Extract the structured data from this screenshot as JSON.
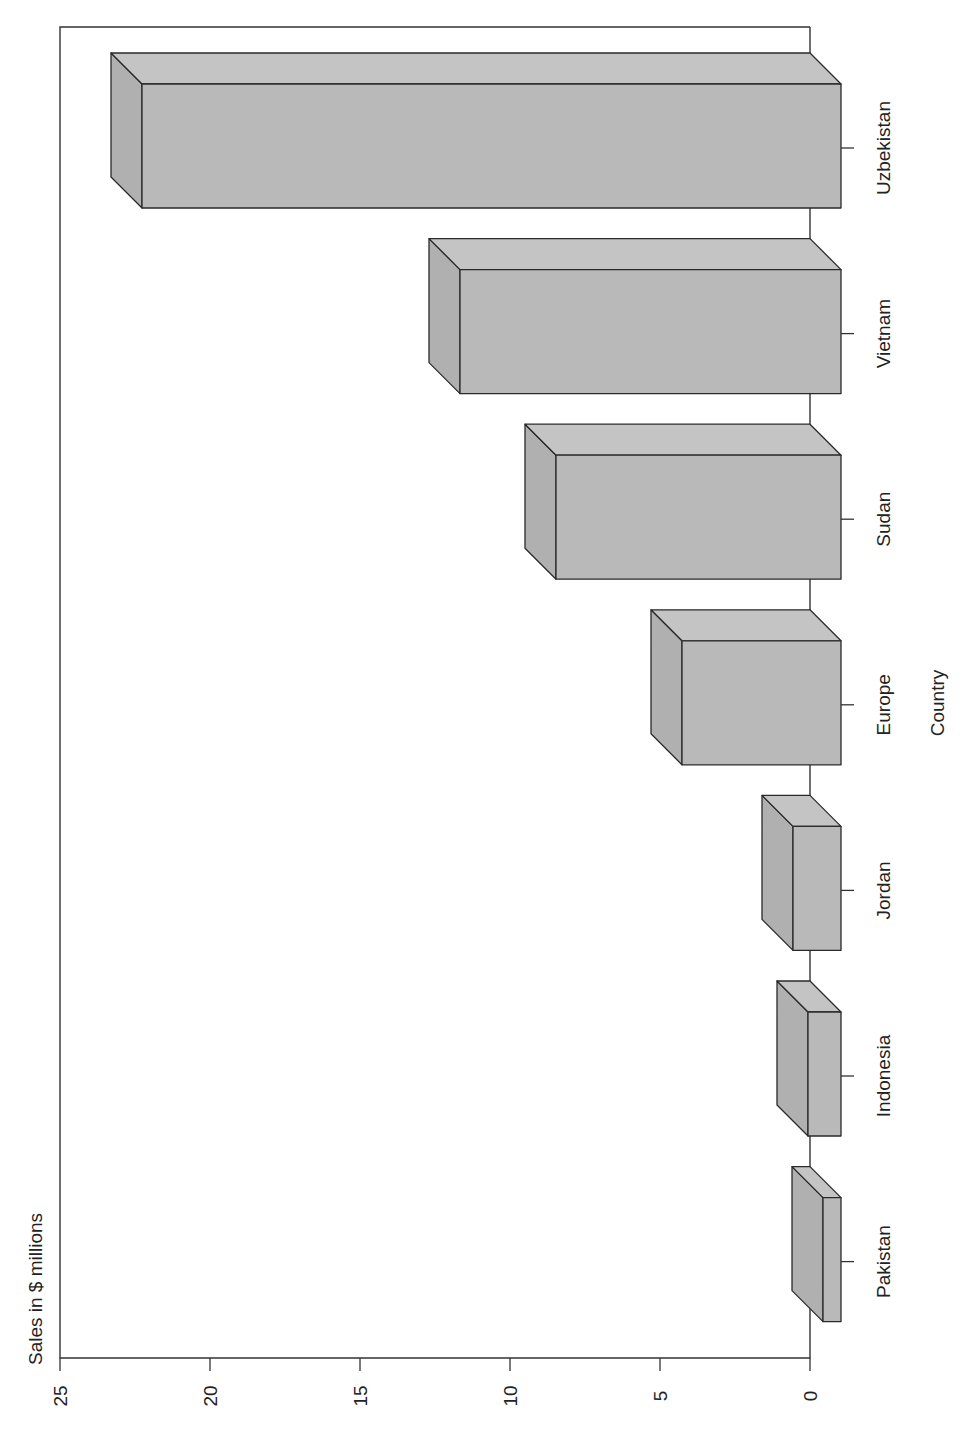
{
  "chart_data": {
    "type": "bar",
    "variant": "3d-column, page rotated 90° counter-clockwise",
    "title": "",
    "xlabel": "Country",
    "ylabel": "Sales in $ millions",
    "categories": [
      "Pakistan",
      "Indonesia",
      "Jordan",
      "Europe",
      "Sudan",
      "Vietnam",
      "Uzbekistan"
    ],
    "values": [
      0.6,
      1.1,
      1.6,
      5.3,
      9.5,
      12.7,
      23.3
    ],
    "ylim": [
      0,
      25
    ],
    "yticks": [
      0,
      5,
      10,
      15,
      20,
      25
    ],
    "ytick_labels": [
      "0",
      "5",
      "10",
      "15",
      "20",
      "25"
    ],
    "grid": false,
    "legend": null,
    "colors": {
      "bar_front": "#b9b9b9",
      "bar_top": "#c4c4c4",
      "bar_side": "#b0b0b0",
      "outline": "#2a2a2a",
      "axis": "#333333",
      "text": "#222222"
    }
  }
}
